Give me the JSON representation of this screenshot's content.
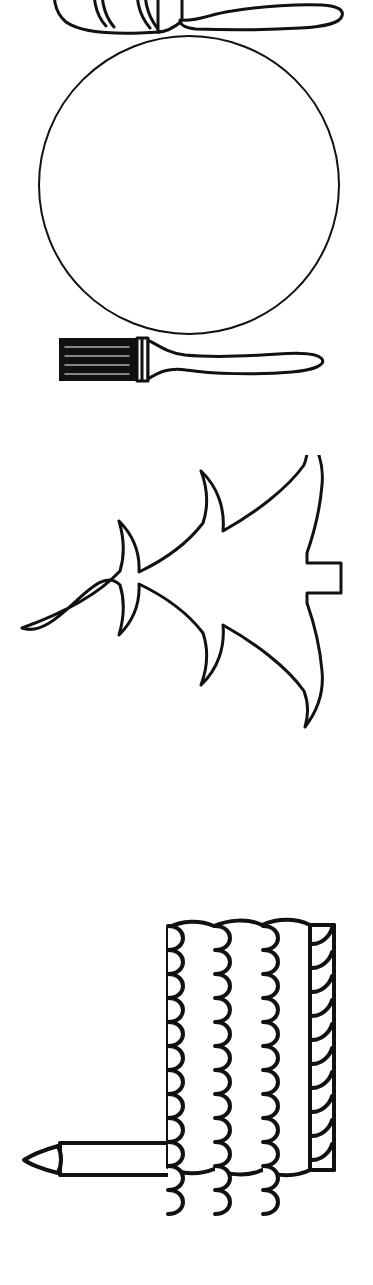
{
  "page": {
    "background_color": "#ffffff",
    "stroke_color": "#111111",
    "width": 373,
    "height": 1285
  },
  "figures": [
    {
      "id": "brush-top",
      "name": "paint-brush-cropped",
      "label": "Paint brush (cropped at top edge)",
      "orientation": "horizontal, bristles left, handle right",
      "cropped": true,
      "bounds": {
        "x": 55,
        "y": 0,
        "width": 287,
        "height": 34
      },
      "stroke_width": 3
    },
    {
      "id": "circle",
      "name": "circle-outline",
      "label": "Plain circle outline",
      "orientation": "centered",
      "cropped": false,
      "bounds": {
        "x": 38,
        "y": 36,
        "width": 302,
        "height": 300
      },
      "stroke_width": 2
    },
    {
      "id": "brush-main",
      "name": "paint-brush",
      "label": "Paint brush with striped bristles",
      "orientation": "horizontal, bristles left, handle right",
      "bristle_stripes": 4,
      "cropped": false,
      "bounds": {
        "x": 58,
        "y": 337,
        "width": 267,
        "height": 50
      },
      "stroke_width": 3
    },
    {
      "id": "tree",
      "name": "christmas-tree",
      "label": "Christmas tree rotated on its side, tip pointing left, trunk at right",
      "orientation": "rotated 90 degrees counter-clockwise",
      "branch_tiers": 3,
      "cropped": false,
      "bounds": {
        "x": 22,
        "y": 474,
        "width": 320,
        "height": 320
      },
      "stroke_width": 3
    },
    {
      "id": "cake",
      "name": "birthday-cake-with-candle",
      "label": "Birthday cake on its side with scalloped frosting bands and one candle",
      "orientation": "rotated 90 degrees, candle points left",
      "frosting_bands": 3,
      "rope_band": 1,
      "candles": 1,
      "cropped": false,
      "bounds": {
        "x": 20,
        "y": 925,
        "width": 315,
        "height": 300
      },
      "stroke_width": 4
    }
  ]
}
